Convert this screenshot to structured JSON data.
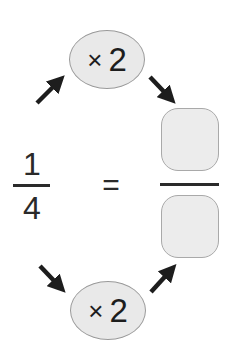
{
  "problem": {
    "fraction": {
      "numerator": "1",
      "denominator": "4"
    },
    "equals_sign": "=",
    "answer": {
      "numerator": "",
      "denominator": ""
    },
    "operators": {
      "top": {
        "symbol": "×",
        "value": "2"
      },
      "bottom": {
        "symbol": "×",
        "value": "2"
      }
    }
  },
  "colors": {
    "oval_fill": "#e9e9e9",
    "oval_border": "#9a9a9a",
    "box_fill": "#ececec",
    "box_border": "#a9a9a9",
    "ink": "#1d1d1d"
  },
  "arrows": [
    {
      "name": "arrow-fraction-to-top-operator",
      "direction": "up-right"
    },
    {
      "name": "arrow-top-operator-to-answer",
      "direction": "down-right"
    },
    {
      "name": "arrow-fraction-to-bottom-operator",
      "direction": "down-right"
    },
    {
      "name": "arrow-bottom-operator-to-answer",
      "direction": "up-right"
    }
  ]
}
